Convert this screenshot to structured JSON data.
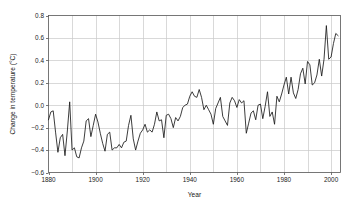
{
  "chart_data": {
    "type": "line",
    "title": "",
    "subtitle": "",
    "xlabel": "Year",
    "ylabel": "Change in temperature (°C)",
    "xlim": [
      1880,
      2004
    ],
    "ylim": [
      -0.6,
      0.8
    ],
    "grid": true,
    "legend": "none",
    "x_ticks": [
      1880,
      1900,
      1920,
      1940,
      1960,
      1980,
      2000
    ],
    "x_tick_labels": [
      "1880",
      "1900",
      "1920",
      "1940",
      "1960",
      "1980",
      "2000"
    ],
    "x_gridlines": [
      1880,
      1890,
      1900,
      1910,
      1920,
      1930,
      1940,
      1950,
      1960,
      1970,
      1980,
      1990,
      2000
    ],
    "y_ticks": [
      -0.6,
      -0.4,
      -0.2,
      0.0,
      0.2,
      0.4,
      0.6,
      0.8
    ],
    "y_tick_labels": [
      "−0.6",
      "−0.4",
      "−0.2",
      "0.0",
      "0.2",
      "0.4",
      "0.6",
      "0.8"
    ],
    "line_color": "#1a1a1a",
    "grid_color": "#c8c8c8",
    "axis_color": "#555555",
    "background_color": "#ffffff",
    "series": [
      {
        "name": "Change in temperature",
        "x": [
          1880,
          1881,
          1882,
          1883,
          1884,
          1885,
          1886,
          1887,
          1888,
          1889,
          1890,
          1891,
          1892,
          1893,
          1894,
          1895,
          1896,
          1897,
          1898,
          1899,
          1900,
          1901,
          1902,
          1903,
          1904,
          1905,
          1906,
          1907,
          1908,
          1909,
          1910,
          1911,
          1912,
          1913,
          1914,
          1915,
          1916,
          1917,
          1918,
          1919,
          1920,
          1921,
          1922,
          1923,
          1924,
          1925,
          1926,
          1927,
          1928,
          1929,
          1930,
          1931,
          1932,
          1933,
          1934,
          1935,
          1936,
          1937,
          1938,
          1939,
          1940,
          1941,
          1942,
          1943,
          1944,
          1945,
          1946,
          1947,
          1948,
          1949,
          1950,
          1951,
          1952,
          1953,
          1954,
          1955,
          1956,
          1957,
          1958,
          1959,
          1960,
          1961,
          1962,
          1963,
          1964,
          1965,
          1966,
          1967,
          1968,
          1969,
          1970,
          1971,
          1972,
          1973,
          1974,
          1975,
          1976,
          1977,
          1978,
          1979,
          1980,
          1981,
          1982,
          1983,
          1984,
          1985,
          1986,
          1987,
          1988,
          1989,
          1990,
          1991,
          1992,
          1993,
          1994,
          1995,
          1996,
          1997,
          1998,
          1999,
          2000,
          2001,
          2002,
          2003
        ],
        "values": [
          -0.13,
          -0.06,
          -0.05,
          -0.24,
          -0.42,
          -0.29,
          -0.26,
          -0.45,
          -0.23,
          0.03,
          -0.4,
          -0.38,
          -0.46,
          -0.47,
          -0.38,
          -0.32,
          -0.14,
          -0.12,
          -0.28,
          -0.18,
          -0.08,
          -0.15,
          -0.25,
          -0.34,
          -0.41,
          -0.26,
          -0.24,
          -0.4,
          -0.38,
          -0.38,
          -0.35,
          -0.38,
          -0.33,
          -0.32,
          -0.18,
          -0.09,
          -0.3,
          -0.4,
          -0.32,
          -0.25,
          -0.22,
          -0.17,
          -0.24,
          -0.22,
          -0.24,
          -0.17,
          -0.06,
          -0.14,
          -0.13,
          -0.29,
          -0.09,
          -0.08,
          -0.12,
          -0.2,
          -0.11,
          -0.14,
          -0.1,
          -0.02,
          0.0,
          0.01,
          0.08,
          0.12,
          0.08,
          0.07,
          0.14,
          0.07,
          -0.04,
          0.0,
          -0.04,
          -0.08,
          -0.17,
          -0.03,
          0.02,
          0.07,
          -0.1,
          -0.14,
          -0.18,
          0.02,
          0.07,
          0.04,
          -0.02,
          0.05,
          0.02,
          0.04,
          -0.25,
          -0.16,
          -0.07,
          -0.05,
          -0.13,
          0.0,
          0.01,
          -0.12,
          -0.01,
          0.12,
          -0.1,
          -0.06,
          -0.17,
          0.08,
          0.03,
          0.1,
          0.18,
          0.25,
          0.1,
          0.25,
          0.11,
          0.06,
          0.14,
          0.28,
          0.33,
          0.19,
          0.39,
          0.36,
          0.18,
          0.2,
          0.27,
          0.41,
          0.26,
          0.41,
          0.71,
          0.41,
          0.43,
          0.55,
          0.64,
          0.62
        ]
      }
    ]
  }
}
